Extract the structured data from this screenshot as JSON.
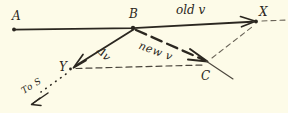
{
  "figure": {
    "type": "hand-drawn-vector-diagram",
    "background_color": "#fdfbe8",
    "ink_color": "#2b2720",
    "points": [
      {
        "id": "A",
        "label": "A",
        "x": 14,
        "y": 29
      },
      {
        "id": "B",
        "label": "B",
        "x": 133,
        "y": 28
      },
      {
        "id": "X",
        "label": "X",
        "x": 256,
        "y": 21
      },
      {
        "id": "Y",
        "label": "Y",
        "x": 71,
        "y": 68
      },
      {
        "id": "C",
        "label": "C",
        "x": 208,
        "y": 62
      }
    ],
    "vectors": [
      {
        "id": "old-v",
        "label": "old v",
        "from": "A",
        "to": "X",
        "style": "solid",
        "arrowhead": true
      },
      {
        "id": "delta-v",
        "label": "Δv",
        "from": "B",
        "to": "Y",
        "style": "solid",
        "arrowhead": true
      },
      {
        "id": "new-v",
        "label": "new v",
        "from": "B",
        "to": "C",
        "style": "dashed",
        "arrowhead": true
      }
    ],
    "guides": [
      {
        "id": "y-to-c-construction",
        "from": "Y",
        "to": "C",
        "style": "dashed"
      },
      {
        "id": "c-to-x-construction",
        "from": "C",
        "to": "X",
        "style": "dashed"
      },
      {
        "id": "x-extension",
        "from": "X",
        "to": "right-edge",
        "style": "dashed"
      },
      {
        "id": "c-through-line",
        "from": "upper-left-of-C",
        "to": "lower-right-of-C",
        "style": "solid-thin"
      }
    ],
    "annotations": [
      {
        "id": "to-s",
        "label": "To S",
        "style": "dotted-arrow",
        "direction": "down-left-from-Y",
        "description": "dotted line from Y toward lower left with arrowhead"
      }
    ]
  }
}
